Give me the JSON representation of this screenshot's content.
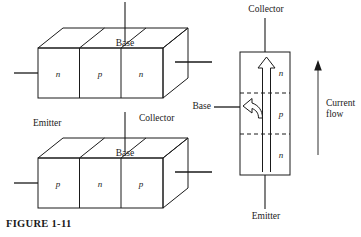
{
  "figure": {
    "caption": "FIGURE 1-11",
    "stroke_color": "#1a1a1a",
    "background_color": "#ffffff"
  },
  "npn_block": {
    "base_label": "Base",
    "regions": [
      "n",
      "p",
      "n"
    ]
  },
  "pnp_block": {
    "emitter_label": "Emitter",
    "collector_label": "Collector",
    "base_label": "Base",
    "regions": [
      "p",
      "n",
      "p"
    ]
  },
  "vertical_npn": {
    "collector_label": "Collector",
    "emitter_label": "Emitter",
    "base_label": "Base",
    "regions": [
      "n",
      "p",
      "n"
    ]
  },
  "current_flow": {
    "line1": "Current",
    "line2": "flow"
  }
}
